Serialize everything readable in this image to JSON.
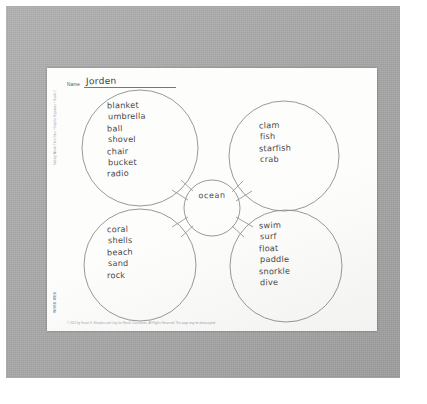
{
  "document": {
    "type": "worksheet",
    "name_label": "Name",
    "name_value": "Jorden",
    "side_print": "Making Words Their Own • Graphic Organizer • Grade 2",
    "corner_print": "WORD WEB",
    "footer_print": "© 2012 by Susan S. Sharples and Cary for Result Classrooms. All Rights Reserved. This page may be photocopied."
  },
  "diagram": {
    "center": {
      "label": "ocean"
    },
    "bubbles": [
      {
        "position": "top-left",
        "words": [
          "blanket",
          "umbrella",
          "ball",
          "shovel",
          "chair",
          "bucket",
          "radio"
        ]
      },
      {
        "position": "top-right",
        "words": [
          "clam",
          "fish",
          "starfish",
          "crab"
        ]
      },
      {
        "position": "bottom-left",
        "words": [
          "coral",
          "shells",
          "beach",
          "sand",
          "rock"
        ]
      },
      {
        "position": "bottom-right",
        "words": [
          "swim",
          "surf",
          "float",
          "paddle",
          "snorkle",
          "dive"
        ]
      }
    ]
  },
  "colors": {
    "mat": "#a9a9a9",
    "page": "#fdfdfc",
    "ink": "#4a4a4a",
    "line": "#8a8a8a"
  }
}
